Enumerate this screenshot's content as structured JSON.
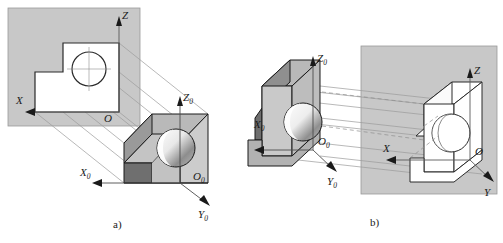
{
  "figure": {
    "background_color": "#ffffff",
    "plane_color": "#c8c8c8",
    "plane_edge_color": "#8a8a8a",
    "outline_color": "#1a1a1a",
    "ray_color": "#9a9a9a",
    "face_colors": {
      "top": "#b4b4b4",
      "front": "#cfcfcf",
      "side_dark": "#6e6e6e",
      "side_mid": "#8f8f8f",
      "hole_light": "#f2f2f2",
      "hole_dark": "#7a7a7a",
      "white": "#ffffff"
    }
  },
  "captions": {
    "a": "a)",
    "b": "b)"
  },
  "panel_a": {
    "name": "projection-onto-plane",
    "plane": {
      "label": "projection-plane"
    },
    "plane_axes": {
      "z": {
        "label": "Z",
        "subscript": ""
      },
      "x": {
        "label": "X",
        "subscript": ""
      },
      "origin": {
        "label": "O",
        "subscript": ""
      }
    },
    "object_axes": {
      "z": {
        "label": "Z",
        "subscript": "0"
      },
      "x": {
        "label": "X",
        "subscript": "0"
      },
      "y": {
        "label": "Y",
        "subscript": "0"
      },
      "origin": {
        "label": "O",
        "subscript": "0"
      }
    },
    "projection_rays": 5,
    "silhouette": "L-shaped outline with circle"
  },
  "panel_b": {
    "name": "projection-onto-plane-axonometric",
    "plane": {
      "label": "projection-plane"
    },
    "plane_axes": {
      "z": {
        "label": "Z",
        "subscript": ""
      },
      "x": {
        "label": "X",
        "subscript": ""
      },
      "y": {
        "label": "Y",
        "subscript": ""
      },
      "origin": {
        "label": "O",
        "subscript": ""
      }
    },
    "object_axes": {
      "z": {
        "label": "Z",
        "subscript": "0"
      },
      "x": {
        "label": "X",
        "subscript": "0"
      },
      "y": {
        "label": "Y",
        "subscript": "0"
      },
      "origin": {
        "label": "O",
        "subscript": "0"
      }
    },
    "projection_rays": 6,
    "silhouette": "axonometric wireframe of the block with circle"
  }
}
